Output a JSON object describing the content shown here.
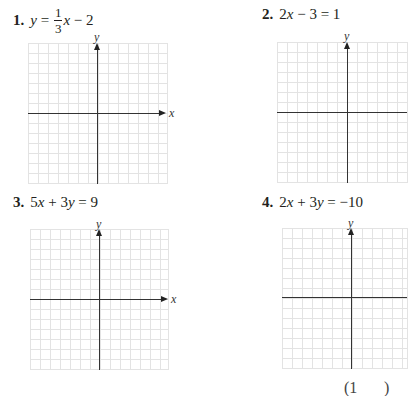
{
  "problems": [
    {
      "number": "1.",
      "equation_parts": {
        "lhs": "y",
        "eq": " = ",
        "frac_num": "1",
        "frac_den": "3",
        "rest_var": "x",
        "rest": " − 2"
      },
      "x_axis_label": "x",
      "y_axis_label": "y"
    },
    {
      "number": "2.",
      "equation": {
        "a": "2",
        "var1": "x",
        "mid": " − 3 = 1"
      },
      "x_axis_label": "x",
      "y_axis_label": "y"
    },
    {
      "number": "3.",
      "equation": {
        "a": "5",
        "var1": "x",
        "op": " + 3",
        "var2": "y",
        "rhs": " = 9"
      },
      "x_axis_label": "x",
      "y_axis_label": "y"
    },
    {
      "number": "4.",
      "equation": {
        "a": "2",
        "var1": "x",
        "op": " + 3",
        "var2": "y",
        "rhs": " = −10"
      },
      "x_axis_label": "x",
      "y_axis_label": "y"
    }
  ],
  "grid": {
    "columns": 14,
    "rows": 14,
    "line_color": "#e3e3e3",
    "axis_color": "#333333"
  },
  "footer_partial": {
    "left": "(1",
    "right": ")"
  }
}
